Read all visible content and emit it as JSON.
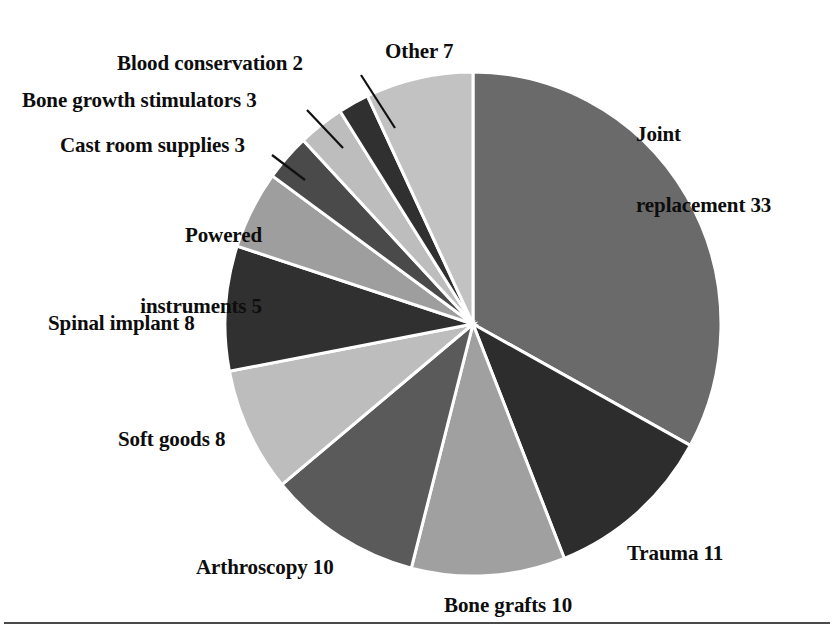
{
  "chart_data": {
    "type": "pie",
    "title": "",
    "subtitle": "",
    "xlabel": "",
    "ylabel": "",
    "legend_position": "none",
    "grid": false,
    "units": "percent",
    "total": 100,
    "start_angle_deg": 0,
    "direction": "mixed",
    "categories": [
      "Joint replacement",
      "Trauma",
      "Bone grafts",
      "Arthroscopy",
      "Soft goods",
      "Spinal implant",
      "Powered instruments",
      "Cast room supplies",
      "Bone growth stimulators",
      "Blood conservation",
      "Other"
    ],
    "values": [
      33,
      11,
      10,
      10,
      8,
      8,
      5,
      3,
      3,
      2,
      7
    ],
    "colors": [
      "#6a6a6a",
      "#2d2d2d",
      "#a0a0a0",
      "#5a5a5a",
      "#bdbdbd",
      "#303030",
      "#9e9e9e",
      "#4a4a4a",
      "#bdbdbd",
      "#303030",
      "#c2c2c2"
    ],
    "slice_border_color": "#ffffff",
    "labels": [
      "Joint replacement 33",
      "Trauma 11",
      "Bone grafts 10",
      "Arthroscopy 10",
      "Soft goods 8",
      "Spinal implant 8",
      "Powered instruments 5",
      "Cast room supplies 3",
      "Bone growth stimulators 3",
      "Blood conservation 2",
      "Other 7"
    ]
  },
  "labels": {
    "joint_replacement_line1": "Joint",
    "joint_replacement_line2": "replacement 33",
    "trauma": "Trauma 11",
    "bone_grafts": "Bone grafts 10",
    "arthroscopy": "Arthroscopy 10",
    "soft_goods": "Soft goods 8",
    "spinal_implant": "Spinal implant 8",
    "powered_instruments_line1": "Powered",
    "powered_instruments_line2": "instruments 5",
    "cast_room_supplies": "Cast room supplies 3",
    "bone_growth_stimulators": "Bone growth stimulators 3",
    "blood_conservation": "Blood conservation 2",
    "other": "Other 7"
  }
}
